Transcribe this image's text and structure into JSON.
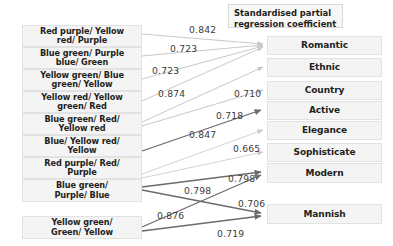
{
  "diagram": {
    "legend": {
      "label": "Standardised partial\nregression coefficient",
      "line1": "Standardised partial",
      "line2": "regression coefficient"
    },
    "colors": {
      "box_fill": "#f4f4f4",
      "box_border": "#e2e2e2",
      "text": "#231f20",
      "arrow_dark": "#6b6b6b",
      "arrow_light": "#c9c9c9",
      "label_text": "#3a3a3a"
    },
    "predictors": [
      {
        "id": "p1",
        "line1": "Red purple/ Yellow",
        "line2": "red/ Purple"
      },
      {
        "id": "p2",
        "line1": "Blue green/ Purple",
        "line2": "blue/ Green"
      },
      {
        "id": "p3",
        "line1": "Yellow green/ Blue",
        "line2": "green/ Yellow"
      },
      {
        "id": "p4",
        "line1": "Yellow red/ Yellow",
        "line2": "green/ Red"
      },
      {
        "id": "p5",
        "line1": "Blue green/ Red/",
        "line2": "Yellow red"
      },
      {
        "id": "p6",
        "line1": "Blue/ Yellow red/",
        "line2": "Yellow"
      },
      {
        "id": "p7",
        "line1": "Red purple/ Red/",
        "line2": "Purple"
      },
      {
        "id": "p8",
        "line1": "Blue green/",
        "line2": "Purple/ Blue"
      },
      {
        "id": "p9",
        "line1": "Yellow green/",
        "line2": "Green/ Yellow"
      }
    ],
    "outcomes": [
      {
        "id": "o1",
        "label": "Romantic"
      },
      {
        "id": "o2",
        "label": "Ethnic"
      },
      {
        "id": "o3",
        "label": "Country"
      },
      {
        "id": "o4",
        "label": "Active"
      },
      {
        "id": "o5",
        "label": "Elegance"
      },
      {
        "id": "o6",
        "label": "Sophisticate"
      },
      {
        "id": "o7",
        "label": "Modern"
      },
      {
        "id": "o8",
        "label": "Mannish"
      }
    ],
    "edges": [
      {
        "from": "p1",
        "to": "o1",
        "value": "0.842",
        "weight": "light"
      },
      {
        "from": "p2",
        "to": "o1",
        "value": "0.723",
        "weight": "light"
      },
      {
        "from": "p3",
        "to": "o1",
        "value": "0.723",
        "weight": "light"
      },
      {
        "from": "p4",
        "to": "o1",
        "value": "0.874",
        "weight": "light"
      },
      {
        "from": "p5",
        "to": "o2",
        "value": "0.710",
        "weight": "light"
      },
      {
        "from": "p5",
        "to": "o3",
        "value": "0.718",
        "weight": "light"
      },
      {
        "from": "p6",
        "to": "o4",
        "value": "0.847",
        "weight": "dark"
      },
      {
        "from": "p7",
        "to": "o5",
        "value": "0.665",
        "weight": "light"
      },
      {
        "from": "p7",
        "to": "o6",
        "value": "0.798",
        "weight": "light"
      },
      {
        "from": "p8",
        "to": "o7",
        "value": "0.798",
        "weight": "dark"
      },
      {
        "from": "p8",
        "to": "o8",
        "value": "0.876",
        "weight": "dark"
      },
      {
        "from": "p9",
        "to": "o7",
        "value": "0.706",
        "weight": "dark"
      },
      {
        "from": "p9",
        "to": "o8",
        "value": "0.719",
        "weight": "dark"
      }
    ]
  }
}
